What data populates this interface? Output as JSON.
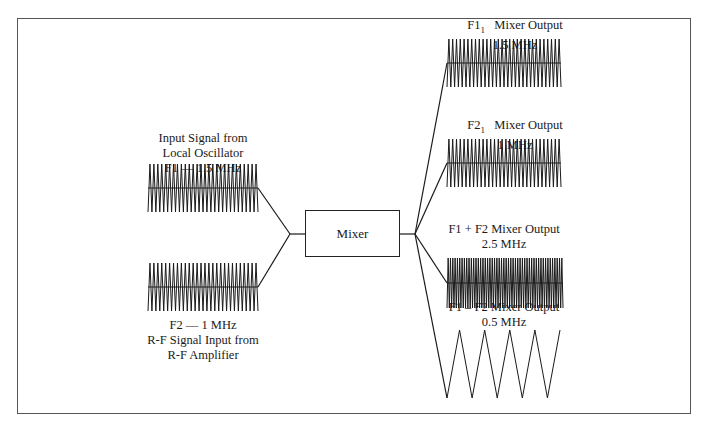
{
  "mixer": {
    "label": "Mixer"
  },
  "inputs": [
    {
      "id": "f1",
      "lines": [
        "Input Signal from",
        "Local Oscillator",
        "F1 — 1.5 MHz"
      ],
      "cycles": 28,
      "y": 188
    },
    {
      "id": "f2",
      "lines": [
        "F2 — 1 MHz",
        "R-F Signal Input from",
        "R-F Amplifier"
      ],
      "cycles": 28,
      "y": 287
    }
  ],
  "outputs": [
    {
      "id": "f1_1",
      "prefix": "F1",
      "sub": "1",
      "title": "Mixer Output",
      "freq": "1.5 MHz",
      "cycles": 30,
      "y": 63
    },
    {
      "id": "f2_1",
      "prefix": "F2",
      "sub": "1",
      "title": "Mixer Output",
      "freq": "1 MHz",
      "cycles": 30,
      "y": 163
    },
    {
      "id": "sum",
      "title": "F1 + F2 Mixer Output",
      "freq": "2.5 MHz",
      "cycles": 50,
      "y": 283
    },
    {
      "id": "diff",
      "title": "F1 – F2 Mixer Output",
      "freq": "0.5 MHz",
      "cycles": 4.5,
      "y": 364
    }
  ],
  "colors": {
    "stroke": "#1a1a1a",
    "frame": "#555555"
  }
}
